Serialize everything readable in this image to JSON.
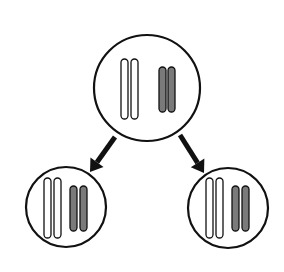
{
  "diagram": {
    "type": "cell-division",
    "colors": {
      "outline": "#111111",
      "light_chromosome": "#ffffff",
      "dark_chromosome": "#7a7a7a",
      "arrow": "#111111",
      "background": "#ffffff"
    },
    "cells": [
      {
        "id": "parent",
        "center": [
          147,
          88
        ],
        "radius": 53,
        "chromosomes": [
          {
            "shade": "light",
            "x": 121,
            "y": 59,
            "w": 7,
            "h": 60
          },
          {
            "shade": "light",
            "x": 131,
            "y": 59,
            "w": 7,
            "h": 60
          },
          {
            "shade": "dark",
            "x": 159,
            "y": 67,
            "w": 7,
            "h": 45
          },
          {
            "shade": "dark",
            "x": 168,
            "y": 67,
            "w": 7,
            "h": 45
          }
        ]
      },
      {
        "id": "daughter-left",
        "center": [
          66,
          207
        ],
        "radius": 40,
        "chromosomes": [
          {
            "shade": "light",
            "x": 44,
            "y": 178,
            "w": 7,
            "h": 60
          },
          {
            "shade": "light",
            "x": 54,
            "y": 178,
            "w": 7,
            "h": 60
          },
          {
            "shade": "dark",
            "x": 70,
            "y": 186,
            "w": 7,
            "h": 45
          },
          {
            "shade": "dark",
            "x": 80,
            "y": 186,
            "w": 7,
            "h": 45
          }
        ]
      },
      {
        "id": "daughter-right",
        "center": [
          228,
          208
        ],
        "radius": 40,
        "chromosomes": [
          {
            "shade": "light",
            "x": 206,
            "y": 178,
            "w": 7,
            "h": 60
          },
          {
            "shade": "light",
            "x": 216,
            "y": 178,
            "w": 7,
            "h": 60
          },
          {
            "shade": "dark",
            "x": 232,
            "y": 186,
            "w": 7,
            "h": 45
          },
          {
            "shade": "dark",
            "x": 242,
            "y": 186,
            "w": 7,
            "h": 45
          }
        ]
      }
    ],
    "arrows": [
      {
        "id": "arrow-left",
        "from": [
          115,
          137
        ],
        "to": [
          90,
          172
        ]
      },
      {
        "id": "arrow-right",
        "from": [
          180,
          135
        ],
        "to": [
          204,
          173
        ]
      }
    ]
  }
}
